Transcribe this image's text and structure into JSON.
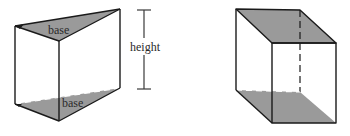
{
  "figure": {
    "colors": {
      "background": "#ffffff",
      "edge": "#1a1a1a",
      "shaded_face": "#9a9a9a",
      "label": "#2a2a2a"
    },
    "prism": {
      "name": "triangular prism",
      "top_base_label": "base",
      "bottom_base_label": "base"
    },
    "dimension": {
      "label": "height"
    },
    "cube": {
      "name": "rectangular prism (cube)"
    }
  }
}
